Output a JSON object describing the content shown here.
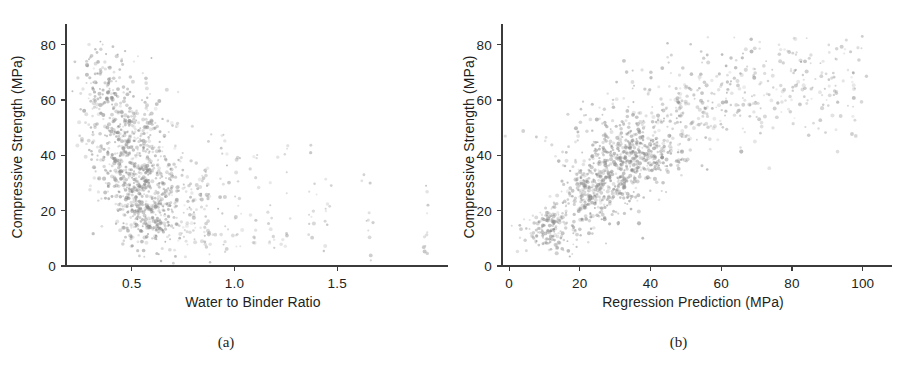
{
  "figure": {
    "background_color": "#ffffff",
    "point_color": "#8a8a8a",
    "axis_color": "#3b3b3b",
    "text_color": "#231f20"
  },
  "panels": [
    {
      "id": "a",
      "caption": "(a)",
      "chart_data": {
        "type": "scatter",
        "title": "",
        "xlabel": "Water to Binder Ratio",
        "ylabel": "Compressive Strength (MPa)",
        "xlim": [
          0.18,
          2.0
        ],
        "ylim": [
          0,
          86
        ],
        "xticks": [
          0.5,
          1.0,
          1.5
        ],
        "xticklabels": [
          "0.5",
          "1.0",
          "1.5"
        ],
        "yticks": [
          0,
          20,
          40,
          60,
          80
        ],
        "yticklabels": [
          "0",
          "20",
          "40",
          "60",
          "80"
        ],
        "grid": false,
        "legend": null,
        "n_points": 1030,
        "marker_size_px": 2.6,
        "marker_opacity": 0.45,
        "description": "Negative non-linear relationship: compressive strength decreases as water to binder ratio increases. Dense cluster between w/b 0.28-0.72 spanning 8-82 MPa; sparse vertical columns of points at discrete ratios from 0.85 to 1.95 mostly below 45 MPa.",
        "clusters": [
          {
            "x_center": 0.42,
            "x_spread": 0.09,
            "y_center": 52,
            "y_spread": 13,
            "count": 180
          },
          {
            "x_center": 0.5,
            "x_spread": 0.08,
            "y_center": 38,
            "y_spread": 11,
            "count": 260
          },
          {
            "x_center": 0.57,
            "x_spread": 0.08,
            "y_center": 27,
            "y_spread": 9,
            "count": 230
          },
          {
            "x_center": 0.6,
            "x_spread": 0.07,
            "y_center": 15,
            "y_spread": 5,
            "count": 120
          },
          {
            "x_center": 0.36,
            "x_spread": 0.06,
            "y_center": 68,
            "y_spread": 8,
            "count": 70
          },
          {
            "x_center": 0.8,
            "x_spread": 0.1,
            "y_center": 22,
            "y_spread": 10,
            "count": 60
          }
        ],
        "sparse_columns": [
          {
            "x": 0.86,
            "y_values": [
              46,
              35,
              29,
              22,
              16,
              12,
              9
            ]
          },
          {
            "x": 0.95,
            "y_values": [
              47,
              40,
              33,
              25,
              18,
              13,
              10,
              7
            ]
          },
          {
            "x": 1.02,
            "y_values": [
              39,
              31,
              24,
              17,
              12,
              8
            ]
          },
          {
            "x": 1.1,
            "y_values": [
              40,
              33,
              26,
              19,
              13,
              9
            ]
          },
          {
            "x": 1.18,
            "y_values": [
              38,
              31,
              23,
              17,
              11,
              8
            ]
          },
          {
            "x": 1.25,
            "y_values": [
              43,
              34,
              26,
              18,
              12,
              9
            ]
          },
          {
            "x": 1.38,
            "y_values": [
              44,
              33,
              26,
              20,
              14,
              8
            ]
          },
          {
            "x": 1.45,
            "y_values": [
              30,
              23,
              17,
              11,
              6
            ]
          },
          {
            "x": 1.65,
            "y_values": [
              31,
              22,
              16,
              10,
              4
            ]
          },
          {
            "x": 1.93,
            "y_values": [
              29,
              22,
              17,
              11,
              7,
              3
            ]
          }
        ]
      }
    },
    {
      "id": "b",
      "caption": "(b)",
      "chart_data": {
        "type": "scatter",
        "title": "",
        "xlabel": "Regression Prediction (MPa)",
        "ylabel": "Compressive Strength (MPa)",
        "xlim": [
          -2,
          106
        ],
        "ylim": [
          0,
          86
        ],
        "xticks": [
          0,
          20,
          40,
          60,
          80,
          100
        ],
        "xticklabels": [
          "0",
          "20",
          "40",
          "60",
          "80",
          "100"
        ],
        "yticks": [
          0,
          20,
          40,
          60,
          80
        ],
        "yticklabels": [
          "0",
          "20",
          "40",
          "60",
          "80"
        ],
        "grid": false,
        "legend": null,
        "n_points": 1030,
        "marker_size_px": 2.6,
        "marker_opacity": 0.45,
        "description": "Positive, concave (saturating) relationship between regression prediction and measured compressive strength. Fan opens from near the origin; spread widens with increasing prediction. Dense core near predictions 10-45 MPa with strengths 10-45 MPa; sparse high-prediction points up to 100 MPa at strengths 55-80 MPa.",
        "trend": {
          "form": "concave",
          "y_at_x": [
            [
              3,
              5
            ],
            [
              10,
              17
            ],
            [
              20,
              28
            ],
            [
              30,
              36
            ],
            [
              40,
              44
            ],
            [
              50,
              54
            ],
            [
              60,
              60
            ],
            [
              80,
              66
            ],
            [
              100,
              70
            ]
          ]
        },
        "clusters": [
          {
            "x_center": 12,
            "x_spread": 4,
            "y_center": 13,
            "y_spread": 4,
            "count": 150
          },
          {
            "x_center": 24,
            "x_spread": 5,
            "y_center": 25,
            "y_spread": 5,
            "count": 190
          },
          {
            "x_center": 30,
            "x_spread": 6,
            "y_center": 33,
            "y_spread": 5,
            "count": 180
          },
          {
            "x_center": 38,
            "x_spread": 6,
            "y_center": 40,
            "y_spread": 5,
            "count": 200
          },
          {
            "x_center": 28,
            "x_spread": 9,
            "y_center": 48,
            "y_spread": 7,
            "count": 130
          },
          {
            "x_center": 48,
            "x_spread": 10,
            "y_center": 60,
            "y_spread": 9,
            "count": 110
          },
          {
            "x_center": 62,
            "x_spread": 12,
            "y_center": 66,
            "y_spread": 8,
            "count": 50
          },
          {
            "x_center": 85,
            "x_spread": 10,
            "y_center": 66,
            "y_spread": 7,
            "count": 20
          }
        ]
      }
    }
  ]
}
